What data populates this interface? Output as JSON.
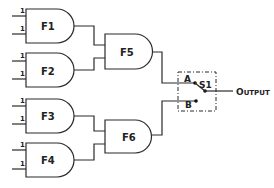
{
  "diagram": {
    "type": "logic-circuit",
    "gates": [
      {
        "id": "F1",
        "label": "F1",
        "inputs": [
          "1",
          "1"
        ]
      },
      {
        "id": "F2",
        "label": "F2",
        "inputs": [
          "1",
          "1"
        ]
      },
      {
        "id": "F3",
        "label": "F3",
        "inputs": [
          "1",
          "1"
        ]
      },
      {
        "id": "F4",
        "label": "F4",
        "inputs": [
          "1",
          "1"
        ]
      },
      {
        "id": "F5",
        "label": "F5",
        "inputs_from": [
          "F1",
          "F2"
        ]
      },
      {
        "id": "F6",
        "label": "F6",
        "inputs_from": [
          "F3",
          "F4"
        ]
      }
    ],
    "switch": {
      "label": "S1",
      "terminal_a": "A",
      "terminal_b": "B",
      "a_from": "F5",
      "b_from": "F6",
      "position": "A"
    },
    "output": {
      "label_first": "O",
      "label_rest": "UTPUT"
    }
  },
  "colors": {
    "line": "#2a2a2a",
    "background": "#ffffff"
  }
}
